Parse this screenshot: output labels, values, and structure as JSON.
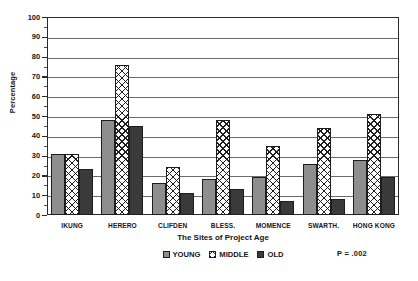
{
  "chart_data": {
    "type": "bar",
    "title": "",
    "xlabel": "The Sites of Project Age",
    "ylabel": "Percentage",
    "ylim": [
      0,
      100
    ],
    "ytick_step": 10,
    "yticks": [
      0,
      10,
      20,
      30,
      40,
      50,
      60,
      70,
      80,
      90,
      100
    ],
    "grid": true,
    "grid_axis": "y",
    "legend_position": "bottom-center",
    "categories": [
      "IKUNG",
      "HERERO",
      "CLIFDEN",
      "BLESS.",
      "MOMENCE",
      "SWARTH.",
      "HONG KONG"
    ],
    "series": [
      {
        "name": "YOUNG",
        "values": [
          31,
          48,
          16,
          18,
          19,
          26,
          28
        ],
        "fill": "gray-stipple",
        "color": "#8e8e8e"
      },
      {
        "name": "MIDDLE",
        "values": [
          31,
          76,
          24,
          48,
          35,
          44,
          51
        ],
        "fill": "cross-hatch",
        "color": "#ffffff"
      },
      {
        "name": "OLD",
        "values": [
          23,
          45,
          11,
          13,
          7,
          8,
          19
        ],
        "fill": "solid-dark",
        "color": "#3a3a3a"
      }
    ],
    "annotations": [
      {
        "name": "p-value",
        "text": "P = .002"
      }
    ]
  },
  "axis": {
    "y_title": "Percentage",
    "x_title": "The Sites of Project Age",
    "y_labels": [
      "100",
      "90",
      "80",
      "70",
      "60",
      "50",
      "40",
      "30",
      "20",
      "10",
      "0"
    ]
  },
  "legend": {
    "items": [
      {
        "label": "YOUNG"
      },
      {
        "label": "MIDDLE"
      },
      {
        "label": "OLD"
      }
    ]
  },
  "annotation": {
    "p_value": "P = .002"
  }
}
